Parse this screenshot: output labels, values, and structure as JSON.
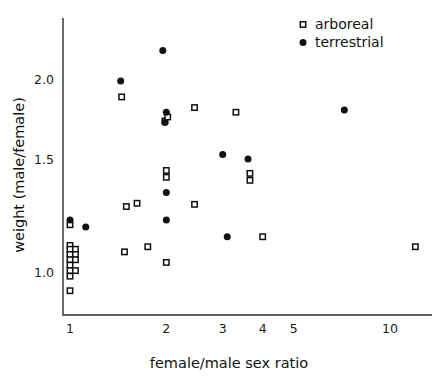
{
  "chart_data": {
    "type": "scatter",
    "title": "",
    "xlabel": "female/male sex ratio",
    "ylabel": "weight (male/female)",
    "xscale": "log",
    "yscale": "log",
    "xlim": [
      0.93,
      13.5
    ],
    "ylim": [
      0.9,
      2.32
    ],
    "grid": false,
    "legend_position": "top-right",
    "xticks": [
      1,
      2,
      3,
      4,
      5,
      10
    ],
    "xtick_labels": [
      "1",
      "2",
      "3",
      "4",
      "5",
      "10"
    ],
    "yticks": [
      1.0,
      1.5,
      2.0
    ],
    "ytick_labels": [
      "1.0",
      "1.5",
      "2.0"
    ],
    "series": [
      {
        "name": "arboreal",
        "marker": "open-square",
        "color": "#111111",
        "points": [
          [
            1.0,
            1.185
          ],
          [
            1.0,
            1.1
          ],
          [
            1.0,
            1.085
          ],
          [
            1.0,
            1.065
          ],
          [
            1.0,
            1.045
          ],
          [
            1.0,
            1.025
          ],
          [
            1.0,
            1.005
          ],
          [
            1.0,
            0.985
          ],
          [
            1.0,
            0.935
          ],
          [
            1.04,
            1.085
          ],
          [
            1.04,
            1.065
          ],
          [
            1.04,
            1.045
          ],
          [
            1.04,
            1.005
          ],
          [
            1.45,
            1.875
          ],
          [
            1.5,
            1.265
          ],
          [
            1.48,
            1.075
          ],
          [
            1.62,
            1.28
          ],
          [
            1.75,
            1.095
          ],
          [
            1.98,
            1.72
          ],
          [
            2.02,
            1.745
          ],
          [
            2.0,
            1.44
          ],
          [
            2.0,
            1.405
          ],
          [
            2.0,
            1.035
          ],
          [
            2.45,
            1.805
          ],
          [
            2.45,
            1.275
          ],
          [
            3.3,
            1.775
          ],
          [
            3.65,
            1.425
          ],
          [
            3.65,
            1.39
          ],
          [
            4.0,
            1.135
          ],
          [
            12.0,
            1.095
          ]
        ]
      },
      {
        "name": "terrestrial",
        "marker": "filled-circle",
        "color": "#111111",
        "points": [
          [
            1.0,
            1.205
          ],
          [
            1.12,
            1.175
          ],
          [
            1.44,
            1.985
          ],
          [
            1.95,
            2.215
          ],
          [
            2.0,
            1.775
          ],
          [
            1.98,
            1.71
          ],
          [
            2.0,
            1.33
          ],
          [
            2.0,
            1.205
          ],
          [
            3.0,
            1.525
          ],
          [
            3.1,
            1.135
          ],
          [
            3.6,
            1.5
          ],
          [
            7.2,
            1.79
          ]
        ]
      }
    ]
  },
  "legend": {
    "items": [
      {
        "label": "arboreal",
        "marker": "open-square"
      },
      {
        "label": "terrestrial",
        "marker": "filled-circle"
      }
    ]
  }
}
